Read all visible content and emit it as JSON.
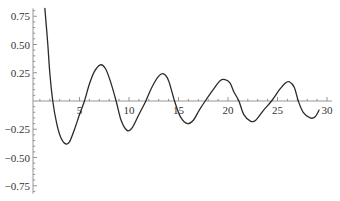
{
  "chart_data": {
    "type": "line",
    "title": "",
    "xlabel": "",
    "ylabel": "",
    "xlim": [
      0.3,
      30.5
    ],
    "ylim": [
      -0.82,
      0.82
    ],
    "grid": false,
    "legend": null,
    "x_ticks": [
      5,
      10,
      15,
      20,
      25,
      30
    ],
    "x_tick_labels": [
      "5",
      "10",
      "15",
      "20",
      "25",
      "30"
    ],
    "x_minor_step": 1,
    "y_ticks": [
      -0.75,
      -0.5,
      -0.25,
      0.25,
      0.5,
      0.75
    ],
    "y_tick_labels": [
      "−0.75",
      "−0.50",
      "−0.25",
      "0.25",
      "0.50",
      "0.75"
    ],
    "y_minor_step": 0.05,
    "colors": {
      "curve": "#2a2a2a",
      "axis": "#8a8a8a",
      "text": "#333333"
    },
    "series": [
      {
        "name": "damped oscillation",
        "x": [
          1.5,
          1.8,
          2.0,
          2.3,
          2.7,
          3.1,
          3.6,
          4.0,
          4.5,
          5.0,
          5.5,
          6.0,
          6.5,
          7.1,
          7.6,
          8.1,
          8.7,
          9.2,
          9.8,
          10.3,
          11.0,
          11.7,
          12.3,
          13.0,
          13.5,
          14.0,
          14.6,
          15.2,
          15.9,
          16.5,
          17.1,
          17.7,
          18.5,
          19.2,
          19.7,
          20.2,
          20.6,
          21.1,
          21.6,
          22.3,
          22.8,
          23.6,
          24.4,
          25.2,
          25.8,
          26.2,
          26.7,
          27.1,
          27.6,
          28.3,
          28.8,
          29.2
        ],
        "y": [
          0.82,
          0.5,
          0.25,
          0.0,
          -0.2,
          -0.32,
          -0.38,
          -0.36,
          -0.25,
          -0.12,
          0.0,
          0.15,
          0.26,
          0.32,
          0.29,
          0.18,
          0.0,
          -0.17,
          -0.26,
          -0.24,
          -0.12,
          0.0,
          0.12,
          0.22,
          0.24,
          0.18,
          0.0,
          -0.14,
          -0.2,
          -0.17,
          -0.08,
          0.0,
          0.1,
          0.18,
          0.19,
          0.16,
          0.08,
          0.0,
          -0.12,
          -0.18,
          -0.17,
          -0.08,
          0.0,
          0.1,
          0.16,
          0.17,
          0.12,
          0.0,
          -0.1,
          -0.15,
          -0.14,
          -0.08
        ]
      }
    ]
  }
}
